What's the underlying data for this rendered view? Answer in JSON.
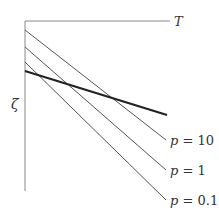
{
  "diagram": {
    "axis_x_label": "T",
    "axis_y_label": "ζ",
    "reference_line": {
      "name": "thick line",
      "x1": 25,
      "y1": 71,
      "x2": 167,
      "y2": 115
    },
    "lines": [
      {
        "p_label": "p",
        "eq": " = ",
        "value": "10",
        "x1": 25,
        "y1": 30,
        "x2": 166,
        "y2": 140
      },
      {
        "p_label": "p",
        "eq": " = ",
        "value": "1",
        "x1": 25,
        "y1": 47,
        "x2": 166,
        "y2": 170
      },
      {
        "p_label": "p",
        "eq": " = ",
        "value": "0.1",
        "x1": 25,
        "y1": 62,
        "x2": 166,
        "y2": 200
      }
    ],
    "colors": {
      "thin": "#555555",
      "thick": "#222222",
      "axis": "#777777"
    }
  }
}
